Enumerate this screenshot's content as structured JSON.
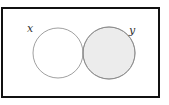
{
  "diagram": {
    "type": "venn",
    "sets": [
      {
        "label": "x",
        "fill": "#ffffff"
      },
      {
        "label": "y",
        "fill": "#ececec"
      }
    ],
    "intersection_fill": "#b4b4b4",
    "border_color": "#111111",
    "circle_stroke": "#888888"
  }
}
